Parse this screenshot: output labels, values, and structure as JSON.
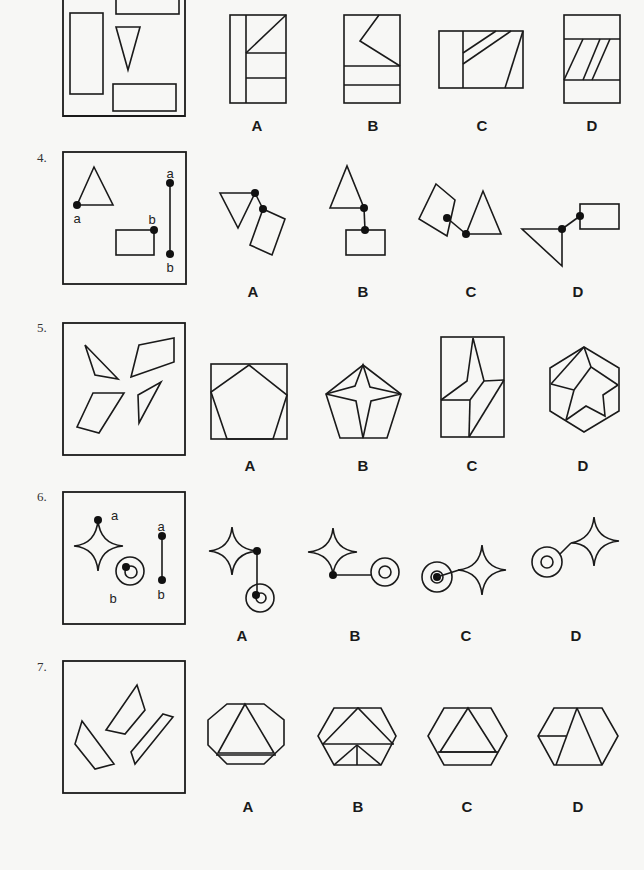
{
  "page": {
    "background": "#f7f7f5",
    "ink_color": "#1a1a1a"
  },
  "questions": [
    {
      "number": "",
      "id": "q3",
      "options": [
        "A",
        "B",
        "C",
        "D"
      ]
    },
    {
      "number": "4.",
      "id": "q4",
      "point_labels": {
        "triangle": "a",
        "rectangle": "b",
        "segment_top": "a",
        "segment_bottom": "b"
      },
      "options": [
        "A",
        "B",
        "C",
        "D"
      ]
    },
    {
      "number": "5.",
      "id": "q5",
      "options": [
        "A",
        "B",
        "C",
        "D"
      ]
    },
    {
      "number": "6.",
      "id": "q6",
      "point_labels": {
        "star": "a",
        "circles": "b",
        "segment_top": "a",
        "segment_bottom": "b"
      },
      "options": [
        "A",
        "B",
        "C",
        "D"
      ]
    },
    {
      "number": "7.",
      "id": "q7",
      "options": [
        "A",
        "B",
        "C",
        "D"
      ]
    }
  ]
}
